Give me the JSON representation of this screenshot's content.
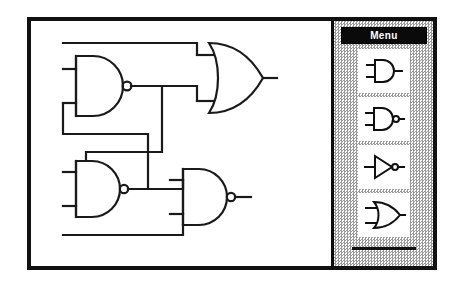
{
  "window": {
    "name": "logic-gate-editor-window"
  },
  "canvas": {
    "name": "circuit-canvas",
    "description": "Cross-coupled NAND latch circuit feeding an OR gate",
    "gates": [
      {
        "id": "nand1",
        "type": "NAND",
        "label": "NAND gate",
        "inputs": 2,
        "bubble": true
      },
      {
        "id": "or1",
        "type": "OR",
        "label": "OR gate",
        "inputs": 2,
        "bubble": false
      },
      {
        "id": "nand2",
        "type": "NAND",
        "label": "NAND gate",
        "inputs": 2,
        "bubble": true
      },
      {
        "id": "nand3",
        "type": "NAND",
        "label": "NAND gate",
        "inputs": 2,
        "bubble": true
      }
    ]
  },
  "palette": {
    "title": "Menu",
    "items": [
      {
        "id": "and",
        "type": "AND",
        "label": "AND gate"
      },
      {
        "id": "nand",
        "type": "NAND",
        "label": "NAND gate"
      },
      {
        "id": "not",
        "type": "NOT",
        "label": "NOT gate"
      },
      {
        "id": "or",
        "type": "OR",
        "label": "OR gate"
      }
    ],
    "divider_label": "separator"
  },
  "colors": {
    "ink": "#111111",
    "paper": "#ffffff",
    "panel_dither_dark": "#9a9a9a",
    "titlebar": "#0a0a0a",
    "titlebar_text": "#ffffff"
  }
}
